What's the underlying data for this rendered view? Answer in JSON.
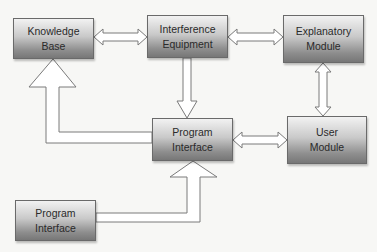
{
  "diagram": {
    "type": "block-diagram",
    "colors": {
      "background": "#f7f7f5",
      "box_top": "#f2f2f2",
      "box_bottom": "#777777",
      "box_border": "#6a6a6a",
      "arrow_fill": "#ffffff",
      "arrow_stroke": "#7a7a7a",
      "text": "#2a2a2a"
    },
    "nodes": {
      "knowledge_base": {
        "line1": "Knowledge",
        "line2": "Base"
      },
      "interference_equipment": {
        "line1": "Interference",
        "line2": "Equipment"
      },
      "explanatory_module": {
        "line1": "Explanatory",
        "line2": "Module"
      },
      "program_interface_center": {
        "line1": "Program",
        "line2": "Interface"
      },
      "user_module": {
        "line1": "User",
        "line2": "Module"
      },
      "program_interface_bottom": {
        "line1": "Program",
        "line2": "Interface"
      }
    },
    "edges": [
      {
        "from": "Knowledge Base",
        "to": "Interference Equipment",
        "style": "double-headed block arrow"
      },
      {
        "from": "Interference Equipment",
        "to": "Explanatory Module",
        "style": "double-headed block arrow"
      },
      {
        "from": "Explanatory Module",
        "to": "User Module",
        "style": "double-headed block arrow"
      },
      {
        "from": "Interference Equipment",
        "to": "Program Interface (center)",
        "style": "block arrow"
      },
      {
        "from": "Program Interface (center)",
        "to": "User Module",
        "style": "double-headed block arrow"
      },
      {
        "from": "Program Interface (center)",
        "to": "Knowledge Base",
        "style": "elbow block arrow"
      },
      {
        "from": "Program Interface (bottom)",
        "to": "Program Interface (center)",
        "style": "elbow block arrow"
      }
    ]
  }
}
